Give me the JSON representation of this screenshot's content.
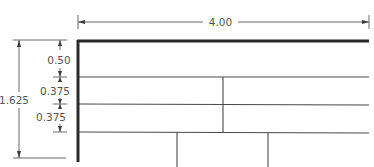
{
  "drawing": {
    "type": "dimensioned-title-block-layout",
    "units": "inches",
    "overall_width": {
      "label": "4.00",
      "value": 4.0
    },
    "overall_height": {
      "label": "1.625",
      "value": 1.625
    },
    "row_heights": [
      {
        "label": "0.50",
        "value": 0.5
      },
      {
        "label": "0.375",
        "value": 0.375
      },
      {
        "label": "0.375",
        "value": 0.375
      }
    ],
    "colors": {
      "line": "#4a4a4a",
      "border": "#2a2a2a",
      "text": "#555555",
      "background": "#ffffff"
    }
  }
}
